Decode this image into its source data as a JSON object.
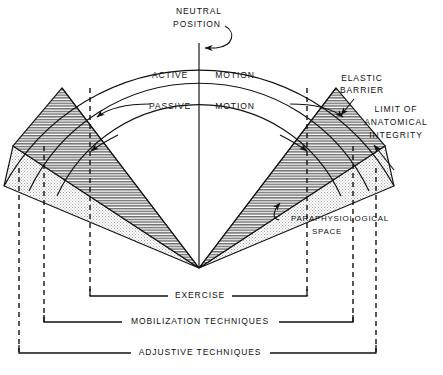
{
  "diagram": {
    "labels": {
      "neutral_position_1": "NEUTRAL",
      "neutral_position_2": "POSITION",
      "active": "ACTIVE",
      "active_motion": "MOTION",
      "passive": "PASSIVE",
      "passive_motion": "MOTION",
      "elastic_barrier_1": "ELASTIC",
      "elastic_barrier_2": "BARRIER",
      "limit_1": "LIMIT OF",
      "limit_2": "ANATOMICAL",
      "limit_3": "INTEGRITY",
      "paraphysiological_1": "PARAPHYSIOLOGICAL",
      "paraphysiological_2": "SPACE",
      "exercise": "EXERCISE",
      "mobilization": "MOBILIZATION  TECHNIQUES",
      "adjustive": "ADJUSTIVE  TECHNIQUES"
    },
    "colors": {
      "ink": "#111111",
      "hatch_dark": "#8a8a8a",
      "stipple_light": "#d8d8d8",
      "background": "#ffffff"
    }
  }
}
